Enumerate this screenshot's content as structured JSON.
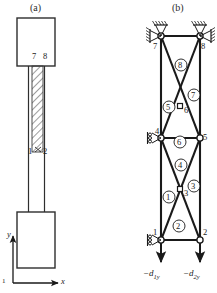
{
  "figure": {
    "panel_a": {
      "caption": "(a)",
      "node_labels": [
        {
          "id": "7",
          "x": 32,
          "y": 56
        },
        {
          "id": "8",
          "x": 44,
          "y": 56
        },
        {
          "id": "1",
          "x": 29,
          "y": 152
        },
        {
          "id": "2",
          "x": 45,
          "y": 152
        }
      ],
      "axes": {
        "x_label": "x",
        "y_label": "y",
        "origin_label": "1"
      }
    },
    "panel_b": {
      "caption": "(b)",
      "node_labels": [
        {
          "id": "7",
          "x": 153,
          "y": 47
        },
        {
          "id": "8",
          "x": 200,
          "y": 47
        },
        {
          "id": "6",
          "x": 184,
          "y": 110
        },
        {
          "id": "4",
          "x": 159,
          "y": 135
        },
        {
          "id": "5",
          "x": 202,
          "y": 143
        },
        {
          "id": "3",
          "x": 184,
          "y": 195
        },
        {
          "id": "1",
          "x": 152,
          "y": 228
        },
        {
          "id": "2",
          "x": 202,
          "y": 228
        }
      ],
      "element_labels": [
        {
          "id": "8",
          "x": 178,
          "y": 62
        },
        {
          "id": "7",
          "x": 191,
          "y": 92
        },
        {
          "id": "5",
          "x": 166,
          "y": 104
        },
        {
          "id": "6",
          "x": 177,
          "y": 139
        },
        {
          "id": "4",
          "x": 178,
          "y": 162
        },
        {
          "id": "3",
          "x": 191,
          "y": 183
        },
        {
          "id": "1",
          "x": 166,
          "y": 194
        },
        {
          "id": "2",
          "x": 176,
          "y": 223
        }
      ],
      "forces": [
        {
          "label_prefix": "−d",
          "sub": "1",
          "suffix": "y",
          "x": 145,
          "y": 270
        },
        {
          "label_prefix": "−d",
          "sub": "2",
          "suffix": "y",
          "x": 185,
          "y": 270
        }
      ]
    }
  },
  "colors": {
    "stroke": "#1a1a1a",
    "fill_node": "#ffffff",
    "background": "#ffffff",
    "hatch": "#555555"
  }
}
